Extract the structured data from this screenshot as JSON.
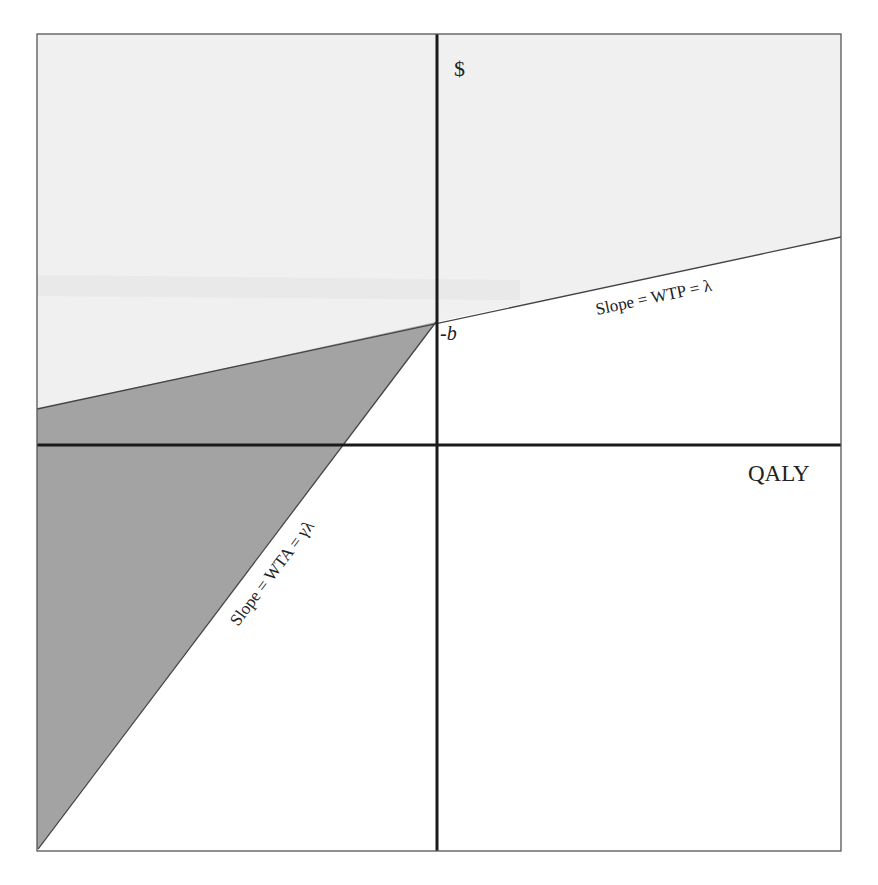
{
  "diagram": {
    "type": "cost-effectiveness plane",
    "axes": {
      "y_label": "$",
      "x_label": "QALY"
    },
    "intercept_label": "-b",
    "lines": [
      {
        "name": "wtp-line",
        "label": "Slope = WTP = λ"
      },
      {
        "name": "wta-line",
        "label": "Slope = WTA = γλ"
      }
    ],
    "colors": {
      "light_region": "#f0f0f0",
      "dark_region": "#a3a3a3",
      "axis": "#1a1a1a",
      "frame": "#555555",
      "line": "#444444"
    }
  }
}
